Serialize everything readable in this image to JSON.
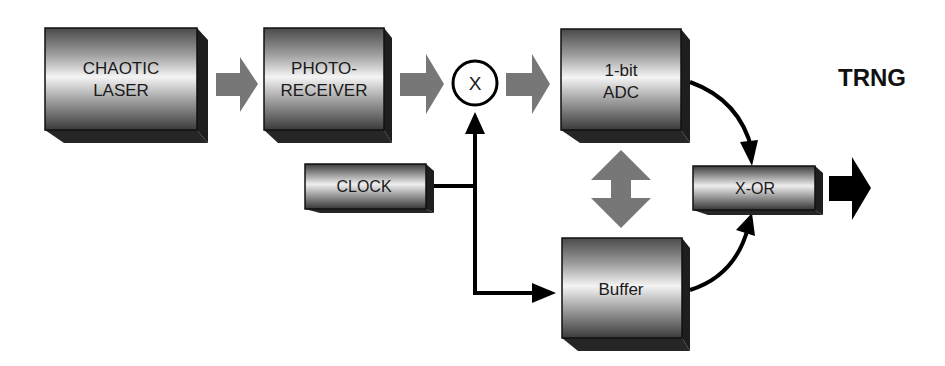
{
  "diagram": {
    "blocks": {
      "laser": {
        "line1": "CHAOTIC",
        "line2": "LASER"
      },
      "photoreceiver": {
        "line1": "PHOTO-",
        "line2": "RECEIVER"
      },
      "mixer": {
        "label": "X"
      },
      "adc": {
        "line1": "1-bit",
        "line2": "ADC"
      },
      "clock": {
        "label": "CLOCK"
      },
      "buffer": {
        "label": "Buffer"
      },
      "xor": {
        "label": "X-OR"
      }
    },
    "output": {
      "label": "TRNG"
    },
    "colors": {
      "block_dark": "#2a2a2a",
      "block_light": "#f2f2f2",
      "gray_arrow": "#777777",
      "black_arrow": "#000000"
    }
  }
}
